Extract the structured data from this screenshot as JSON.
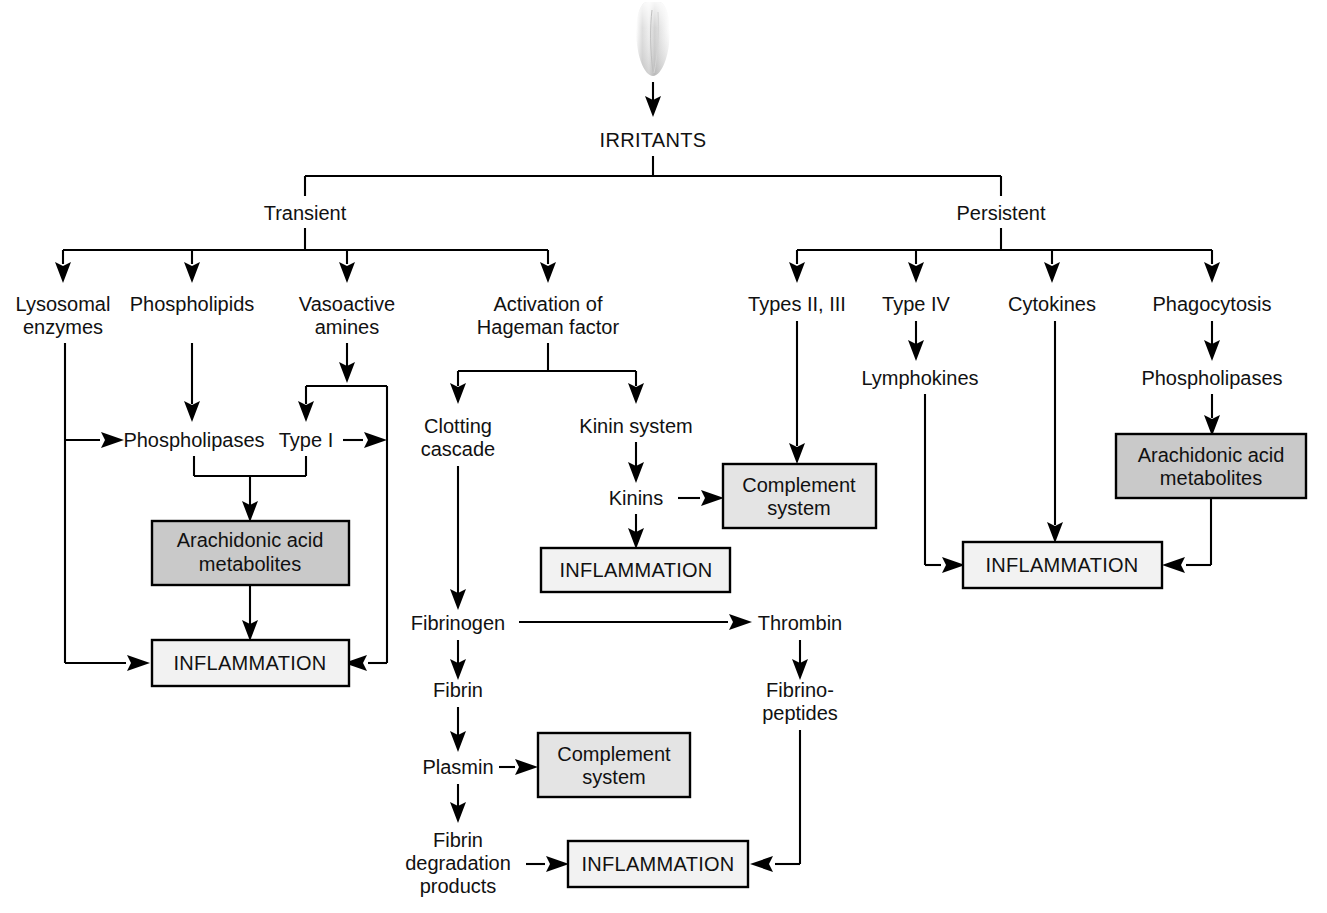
{
  "diagram": {
    "title": "IRRITANTS",
    "root": {
      "label": "IRRITANTS"
    },
    "branches": {
      "left": {
        "label": "Transient"
      },
      "right": {
        "label": "Persistent"
      }
    },
    "nodes": {
      "lysosomal_enzymes": {
        "line1": "Lysosomal",
        "line2": "enzymes"
      },
      "phospholipids": {
        "line1": "Phospholipids"
      },
      "vasoactive_amines": {
        "line1": "Vasoactive",
        "line2": "amines"
      },
      "hageman": {
        "line1": "Activation of",
        "line2": "Hageman factor"
      },
      "phospholipases_left": {
        "line1": "Phospholipases"
      },
      "type_i": {
        "line1": "Type I"
      },
      "clotting_cascade": {
        "line1": "Clotting",
        "line2": "cascade"
      },
      "kinin_system": {
        "line1": "Kinin system"
      },
      "kinins": {
        "line1": "Kinins"
      },
      "fibrinogen": {
        "line1": "Fibrinogen"
      },
      "fibrin": {
        "line1": "Fibrin"
      },
      "plasmin": {
        "line1": "Plasmin"
      },
      "fibrin_degradation": {
        "line1": "Fibrin",
        "line2": "degradation",
        "line3": "products"
      },
      "thrombin": {
        "line1": "Thrombin"
      },
      "fibrinopeptides": {
        "line1": "Fibrino-",
        "line2": "peptides"
      },
      "types_ii_iii": {
        "line1": "Types II, III"
      },
      "type_iv": {
        "line1": "Type IV"
      },
      "lymphokines": {
        "line1": "Lymphokines"
      },
      "cytokines": {
        "line1": "Cytokines"
      },
      "phagocytosis": {
        "line1": "Phagocytosis"
      },
      "phospholipases_right": {
        "line1": "Phospholipases"
      }
    },
    "boxes": {
      "arachidonic_left": {
        "line1": "Arachidonic acid",
        "line2": "metabolites",
        "fill": "#c9c9c9"
      },
      "arachidonic_right": {
        "line1": "Arachidonic acid",
        "line2": "metabolites",
        "fill": "#c9c9c9"
      },
      "complement_upper": {
        "line1": "Complement",
        "line2": "system",
        "fill": "#e4e4e4"
      },
      "complement_lower": {
        "line1": "Complement",
        "line2": "system",
        "fill": "#e4e4e4"
      },
      "inflammation_left": {
        "line1": "INFLAMMATION",
        "fill": "#f2f2f2"
      },
      "inflammation_kinin": {
        "line1": "INFLAMMATION",
        "fill": "#f2f2f2"
      },
      "inflammation_bottom": {
        "line1": "INFLAMMATION",
        "fill": "#f2f2f2"
      },
      "inflammation_right": {
        "line1": "INFLAMMATION",
        "fill": "#f2f2f2"
      }
    },
    "colors": {
      "line": "#000000",
      "text": "#111111",
      "box_gray": "#c9c9c9",
      "box_light": "#f2f2f2",
      "background": "#ffffff"
    },
    "decoration": {
      "name": "brush-tip-illustration"
    }
  }
}
